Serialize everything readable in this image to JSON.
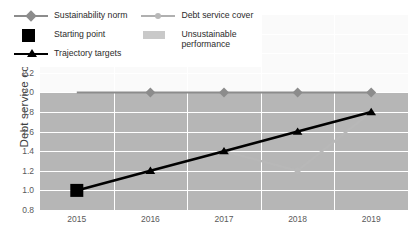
{
  "chart_data": {
    "type": "line",
    "title": "",
    "xlabel": "",
    "ylabel": "Debt service cover",
    "x": [
      "2015",
      "2016",
      "2017",
      "2018",
      "2019"
    ],
    "ylim": [
      0.8,
      2.8
    ],
    "yticks": [
      "0.8",
      "1.0",
      "1.2",
      "1.4",
      "1.6",
      "1.8",
      "2.0",
      "2.2",
      "2.4",
      "2.6",
      "2.8"
    ],
    "grid": true,
    "legend_position": "upper-left-inside",
    "series": [
      {
        "name": "Sustainability norm",
        "values": [
          2.0,
          2.0,
          2.0,
          2.0,
          2.0
        ],
        "color": "#8c8c8c",
        "marker": "diamond",
        "marker_at": [
          "2016",
          "2017",
          "2018",
          "2019"
        ]
      },
      {
        "name": "Debt service cover",
        "values": [
          1.0,
          1.2,
          1.4,
          1.2,
          1.8
        ],
        "color": "#b8b8b8",
        "marker": "circle"
      },
      {
        "name": "Trajectory targets",
        "values": [
          1.0,
          1.2,
          1.4,
          1.6,
          1.8
        ],
        "color": "#000000",
        "marker": "triangle"
      }
    ],
    "annotations": [
      {
        "name": "Starting point",
        "x": "2015",
        "y": 1.0,
        "marker": "square",
        "color": "#000000"
      }
    ],
    "bands": [
      {
        "name": "Unsustainable performance",
        "from": 0.8,
        "to": 2.0,
        "color": "#b6b6b6"
      }
    ]
  },
  "legend": {
    "column_left": [
      {
        "label": "Sustainability norm",
        "symbol": "line-diamond-icon"
      },
      {
        "label": "Starting point",
        "symbol": "square-icon"
      },
      {
        "label": "Trajectory targets",
        "symbol": "line-triangle-icon"
      }
    ],
    "column_right": [
      {
        "label": "Debt service cover",
        "symbol": "line-circle-icon"
      },
      {
        "label": "Unsustainable\nperformance",
        "symbol": "band-swatch-icon"
      }
    ]
  },
  "axes": {
    "y_title": "Debt service cover",
    "y_labels": [
      "2.8",
      "2.6",
      "2.4",
      "2.2",
      "2.0",
      "1.8",
      "1.6",
      "1.4",
      "1.2",
      "1.0",
      "0.8"
    ],
    "x_labels": [
      "2015",
      "2016",
      "2017",
      "2018",
      "2019"
    ]
  },
  "colors": {
    "band": "#b6b6b6",
    "plot_background": "#fafafa",
    "norm": "#8c8c8c",
    "dsc": "#b8b8b8",
    "trajectory": "#000000",
    "grid": "#ffffff"
  }
}
